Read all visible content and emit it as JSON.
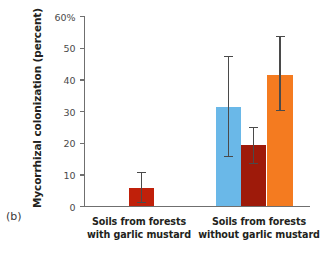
{
  "figure": {
    "panel_letter": "(b)",
    "ylabel": "Mycorrhizal colonization (percent)"
  },
  "chart_data": {
    "type": "bar",
    "title": "",
    "xlabel": "",
    "ylabel": "Mycorrhizal colonization (percent)",
    "ylim": [
      0,
      60
    ],
    "yticks": [
      0,
      10,
      20,
      30,
      40,
      50,
      60
    ],
    "ytick_labels": [
      "0",
      "10",
      "20",
      "30",
      "40",
      "50",
      "60%"
    ],
    "grid": false,
    "legend": "none",
    "categories": [
      "Soils from forests with garlic mustard",
      "Soils from forests without garlic mustard"
    ],
    "category_lines": [
      [
        "Soils from forests",
        "with garlic mustard"
      ],
      [
        "Soils from forests",
        "without garlic mustard"
      ]
    ],
    "bars": [
      {
        "group": 0,
        "index": 0,
        "value": 5.8,
        "err_low": 1.3,
        "err_high": 10.8,
        "color": "#c0200a",
        "name": "bar-group1-red"
      },
      {
        "group": 1,
        "index": 0,
        "value": 31.3,
        "err_low": 15.8,
        "err_high": 47.5,
        "color": "#6ab8e8",
        "name": "bar-group2-blue"
      },
      {
        "group": 1,
        "index": 1,
        "value": 19.3,
        "err_low": 13.5,
        "err_high": 25.0,
        "color": "#9e1a0a",
        "name": "bar-group2-darkred"
      },
      {
        "group": 1,
        "index": 2,
        "value": 41.5,
        "err_low": 30.3,
        "err_high": 53.7,
        "color": "#f47b20",
        "name": "bar-group2-orange"
      }
    ],
    "colors": {
      "red": "#c0200a",
      "blue": "#6ab8e8",
      "dark_red": "#9e1a0a",
      "orange": "#f47b20",
      "axis": "#6f6f6f",
      "error_bar": "#4a4a4a",
      "text": "#231f20"
    }
  },
  "ticks": [
    {
      "value": 0,
      "label": "0"
    },
    {
      "value": 10,
      "label": "10"
    },
    {
      "value": 20,
      "label": "20"
    },
    {
      "value": 30,
      "label": "30"
    },
    {
      "value": 40,
      "label": "40"
    },
    {
      "value": 50,
      "label": "50"
    },
    {
      "value": 60,
      "label": "60%"
    }
  ],
  "group_labels": [
    {
      "line1": "Soils from forests",
      "line2": "with garlic mustard"
    },
    {
      "line1": "Soils from forests",
      "line2": "without garlic mustard"
    }
  ]
}
